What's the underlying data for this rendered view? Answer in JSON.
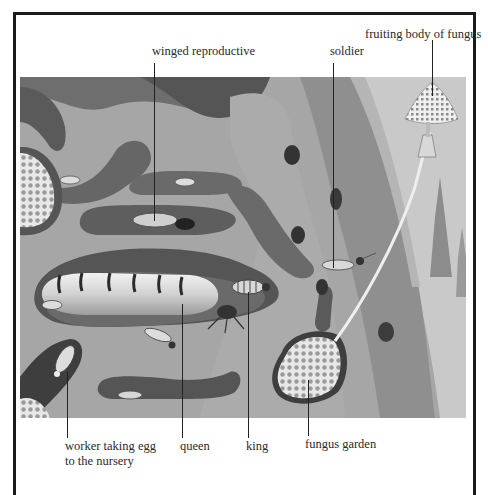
{
  "figure": {
    "labels": {
      "winged_reproductive": "winged reproductive",
      "soldier": "soldier",
      "fruiting_body": "fruiting body of fungus",
      "worker_line1": "worker taking egg",
      "worker_line2": "to the nursery",
      "queen": "queen",
      "king": "king",
      "fungus_garden": "fungus garden"
    },
    "colors": {
      "background": "#ffffff",
      "frame": "#1a1a1a",
      "soil_light": "#a8a8a8",
      "soil_mid": "#8a8a8a",
      "tunnel_dark": "#5a5a5a",
      "sky": "#c9c9c9",
      "text": "#2a2a2a"
    }
  }
}
